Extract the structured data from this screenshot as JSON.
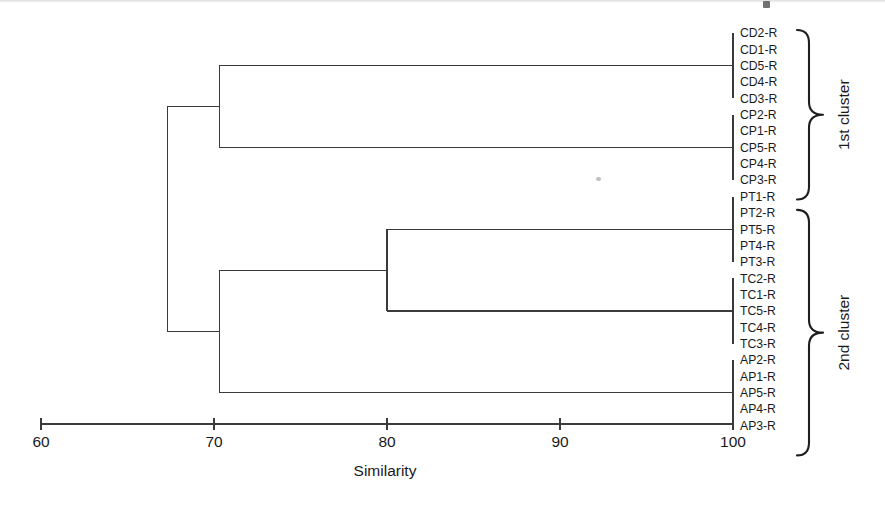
{
  "chart_data": {
    "type": "dendrogram",
    "title": "",
    "xlabel": "Similarity",
    "ylabel": "",
    "xlim": [
      60,
      100
    ],
    "xticks": [
      60,
      70,
      80,
      90,
      100
    ],
    "xtick_labels": [
      "60",
      "70",
      "80",
      "90",
      "100"
    ],
    "grid": false,
    "legend_position": "right-annotations",
    "orientation": "horizontal-right-leaves",
    "leaf_labels": [
      "CD2-R",
      "CD1-R",
      "CD5-R",
      "CD4-R",
      "CD3-R",
      "CP2-R",
      "CP1-R",
      "CP5-R",
      "CP4-R",
      "CP3-R",
      "PT1-R",
      "PT2-R",
      "PT5-R",
      "PT4-R",
      "PT3-R",
      "TC2-R",
      "TC1-R",
      "TC5-R",
      "TC4-R",
      "TC3-R",
      "AP2-R",
      "AP1-R",
      "AP5-R",
      "AP4-R",
      "AP3-R"
    ],
    "groups": [
      {
        "name": "CD",
        "leaves": [
          "CD2-R",
          "CD1-R",
          "CD5-R",
          "CD4-R",
          "CD3-R"
        ],
        "merge_similarity": 100
      },
      {
        "name": "CP",
        "leaves": [
          "CP2-R",
          "CP1-R",
          "CP5-R",
          "CP4-R",
          "CP3-R"
        ],
        "merge_similarity": 100
      },
      {
        "name": "PT",
        "leaves": [
          "PT1-R",
          "PT2-R",
          "PT5-R",
          "PT4-R",
          "PT3-R"
        ],
        "merge_similarity": 100
      },
      {
        "name": "TC",
        "leaves": [
          "TC2-R",
          "TC1-R",
          "TC5-R",
          "TC4-R",
          "TC3-R"
        ],
        "merge_similarity": 100
      },
      {
        "name": "AP",
        "leaves": [
          "AP2-R",
          "AP1-R",
          "AP5-R",
          "AP4-R",
          "AP3-R"
        ],
        "merge_similarity": 100
      }
    ],
    "merges": [
      {
        "id": "m1",
        "left": "CD",
        "right": "CP",
        "similarity": 70.3
      },
      {
        "id": "m2",
        "left": "PT",
        "right": "TC",
        "similarity": 80.0
      },
      {
        "id": "m3",
        "left": "m2",
        "right": "AP",
        "similarity": 70.3
      },
      {
        "id": "m4",
        "left": "m1",
        "right": "m3",
        "similarity": 67.3
      }
    ],
    "annotations": [
      {
        "label": "1st cluster",
        "spans": [
          "CD2-R",
          "PT1-R"
        ]
      },
      {
        "label": "2nd cluster",
        "spans": [
          "PT2-R",
          "AP3-R"
        ]
      }
    ]
  },
  "axis": {
    "title": "Similarity",
    "ticks": [
      "60",
      "70",
      "80",
      "90",
      "100"
    ]
  },
  "leaves": [
    {
      "label": "CD2-R"
    },
    {
      "label": "CD1-R"
    },
    {
      "label": "CD5-R"
    },
    {
      "label": "CD4-R"
    },
    {
      "label": "CD3-R"
    },
    {
      "label": "CP2-R"
    },
    {
      "label": "CP1-R"
    },
    {
      "label": "CP5-R"
    },
    {
      "label": "CP4-R"
    },
    {
      "label": "CP3-R"
    },
    {
      "label": "PT1-R"
    },
    {
      "label": "PT2-R"
    },
    {
      "label": "PT5-R"
    },
    {
      "label": "PT4-R"
    },
    {
      "label": "PT3-R"
    },
    {
      "label": "TC2-R"
    },
    {
      "label": "TC1-R"
    },
    {
      "label": "TC5-R"
    },
    {
      "label": "TC4-R"
    },
    {
      "label": "TC3-R"
    },
    {
      "label": "AP2-R"
    },
    {
      "label": "AP1-R"
    },
    {
      "label": "AP5-R"
    },
    {
      "label": "AP4-R"
    },
    {
      "label": "AP3-R"
    }
  ],
  "clusters": [
    {
      "label": "1st cluster"
    },
    {
      "label": "2nd cluster"
    }
  ],
  "colors": {
    "line": "#3b3b3b",
    "text": "#1a1a1a",
    "background": "#ffffff",
    "brace": "#1f1f1f"
  }
}
